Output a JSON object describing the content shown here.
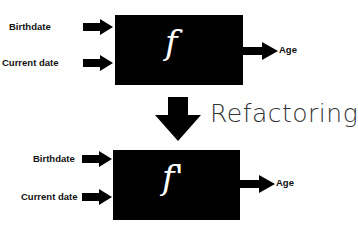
{
  "top": {
    "function_label": "f",
    "inputs": [
      "Birthdate",
      "Current date"
    ],
    "output": "Age"
  },
  "transition": {
    "label": "Refactoring"
  },
  "bottom": {
    "function_label": "f'",
    "inputs": [
      "Birthdate",
      "Current date"
    ],
    "output": "Age"
  }
}
